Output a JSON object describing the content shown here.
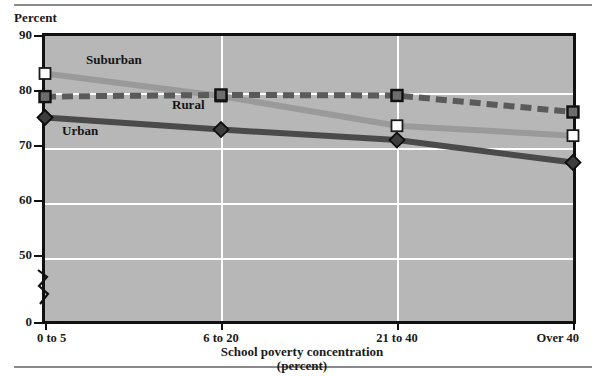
{
  "axis_unit_label": "Percent",
  "chart_data": {
    "type": "line",
    "title": "",
    "xlabel": "School poverty concentration",
    "xlabel_sub": "(percent)",
    "ylabel": "Percent",
    "categories": [
      "0 to 5",
      "6 to 20",
      "21 to 40",
      "Over 40"
    ],
    "yticks": [
      90,
      80,
      70,
      60,
      50,
      0
    ],
    "ylim": [
      0,
      90
    ],
    "y_axis_break": true,
    "grid": "horizontal-and-vertical",
    "legend": "inline-labels",
    "series": [
      {
        "name": "Suburban",
        "values": [
          83.0,
          78.9,
          73.5,
          71.7
        ],
        "color": "#9a9a9a",
        "marker": "open-square",
        "line_style": "solid"
      },
      {
        "name": "Rural",
        "values": [
          78.8,
          79.1,
          79.0,
          76.0
        ],
        "color": "#5a5a5a",
        "marker": "filled-square",
        "line_style": "dashed"
      },
      {
        "name": "Urban",
        "values": [
          75.0,
          72.8,
          70.9,
          66.8
        ],
        "color": "#4a4a4a",
        "marker": "filled-diamond",
        "line_style": "solid"
      }
    ]
  },
  "colors": {
    "plot_background": "#b7b7b7",
    "gridline": "#ffffff",
    "axis": "#111111",
    "rule": "#8a8a8a",
    "suburban": "#9a9a9a",
    "rural": "#5a5a5a",
    "urban": "#4a4a4a"
  }
}
